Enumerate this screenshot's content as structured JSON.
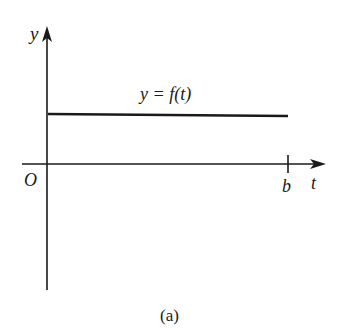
{
  "figure": {
    "caption": "(a)",
    "axes": {
      "y_label": "y",
      "x_label": "t",
      "origin_label": "O",
      "x_tick_label": "b"
    },
    "function_label_prefix": "y = ",
    "function_label_f": "f",
    "function_label_arg": "(t)",
    "function_label": "y = f(t)",
    "colors": {
      "stroke": "#1a1a1a",
      "background": "#ffffff"
    }
  }
}
